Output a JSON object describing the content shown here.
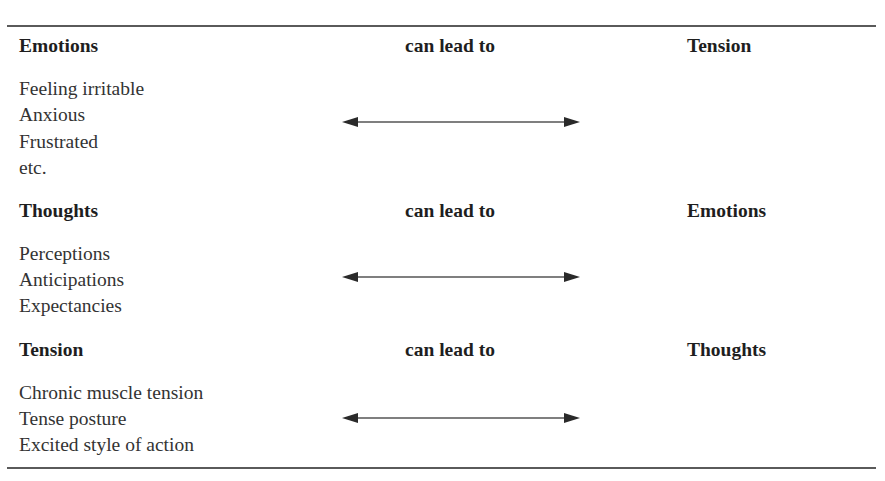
{
  "table": {
    "sections": [
      {
        "source": "Emotions",
        "relation": "can lead to",
        "target": "Tension",
        "items": [
          "Feeling irritable",
          "Anxious",
          "Frustrated",
          "etc."
        ],
        "arrow": "bidirectional-arrow"
      },
      {
        "source": "Thoughts",
        "relation": "can lead to",
        "target": "Emotions",
        "items": [
          "Perceptions",
          "Anticipations",
          "Expectancies"
        ],
        "arrow": "bidirectional-arrow"
      },
      {
        "source": "Tension",
        "relation": "can lead to",
        "target": "Thoughts",
        "items": [
          "Chronic muscle tension",
          "Tense posture",
          "Excited style of action"
        ],
        "arrow": "bidirectional-arrow"
      }
    ]
  },
  "colors": {
    "text": "#2a2a2a",
    "heading": "#1e1e1e",
    "rule": "#5a5a5a",
    "arrow": "#2a2a2a"
  }
}
